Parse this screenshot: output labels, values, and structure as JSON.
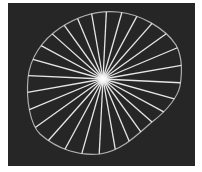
{
  "image": {
    "description": "Dark panel showing an irregular circular outline with white spokes radiating from a bright center",
    "background_color": "#262626",
    "line_color": "#e8e8e8",
    "outline_color": "#b8b8b8",
    "center": [
      103,
      79
    ],
    "spoke_count": 28
  }
}
